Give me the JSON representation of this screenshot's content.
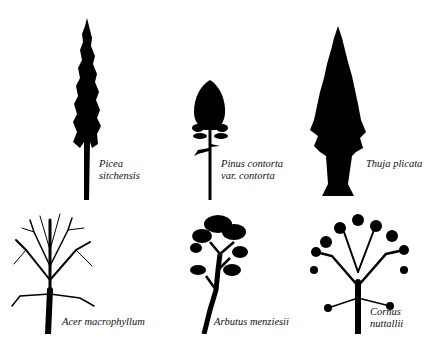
{
  "figure": {
    "trees": [
      {
        "id": "picea",
        "label_lines": [
          "Picea",
          "sitchensis"
        ]
      },
      {
        "id": "pinus",
        "label_lines": [
          "Pinus contorta",
          "var. contorta"
        ]
      },
      {
        "id": "thuja",
        "label_lines": [
          "Thuja plicata"
        ]
      },
      {
        "id": "acer",
        "label_lines": [
          "Acer macrophyllum"
        ]
      },
      {
        "id": "arbutus",
        "label_lines": [
          "Arbutus menziesii"
        ]
      },
      {
        "id": "cornus",
        "label_lines": [
          "Cornus",
          "nuttallii"
        ]
      }
    ],
    "colors": {
      "silhouette": "#000000",
      "background": "#ffffff",
      "text": "#111111"
    }
  }
}
